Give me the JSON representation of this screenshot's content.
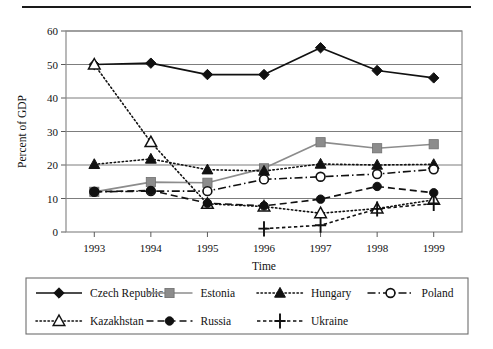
{
  "figure": {
    "has_top_rule": true
  },
  "chart_data": {
    "type": "line",
    "title": "",
    "xlabel": "Time",
    "ylabel": "Percent of GDP",
    "x": [
      1993,
      1994,
      1995,
      1996,
      1997,
      1998,
      1999
    ],
    "xtick_labels": [
      "1993",
      "1994",
      "1995",
      "1996",
      "1997",
      "1998",
      "1999"
    ],
    "ytick_labels": [
      "0",
      "10",
      "20",
      "30",
      "40",
      "50",
      "60"
    ],
    "ylim": [
      0,
      60
    ],
    "ytick_step": 10,
    "grid": "horizontal",
    "legend_position": "bottom-outside",
    "legend_columns": 4,
    "series": [
      {
        "name": "Czech Republic",
        "marker": "filled-diamond",
        "dash": "solid",
        "color": "#111111",
        "values": [
          50.0,
          50.4,
          47.0,
          47.0,
          55.0,
          48.2,
          46.0
        ]
      },
      {
        "name": "Estonia",
        "marker": "filled-square",
        "dash": "solid",
        "color": "#8c8c8c",
        "values": [
          12.0,
          14.9,
          14.7,
          19.0,
          26.8,
          25.0,
          26.2
        ]
      },
      {
        "name": "Hungary",
        "marker": "filled-triangle",
        "dash": "dotted",
        "color": "#111111",
        "values": [
          20.2,
          21.8,
          18.6,
          18.2,
          20.3,
          20.0,
          20.2
        ]
      },
      {
        "name": "Poland",
        "marker": "open-circle",
        "dash": "dashdot",
        "color": "#111111",
        "values": [
          12.0,
          12.2,
          12.2,
          15.7,
          16.5,
          17.3,
          18.7
        ]
      },
      {
        "name": "Kazakhstan",
        "marker": "open-triangle",
        "dash": "dotted",
        "color": "#111111",
        "values": [
          50.0,
          26.8,
          8.4,
          7.6,
          5.6,
          7.0,
          9.6
        ]
      },
      {
        "name": "Russia",
        "marker": "filled-circle",
        "dash": "dashed",
        "color": "#111111",
        "values": [
          12.0,
          12.4,
          8.6,
          7.8,
          9.8,
          13.6,
          11.7
        ]
      },
      {
        "name": "Ukraine",
        "marker": "plus",
        "dash": "dashed-fine",
        "color": "#111111",
        "values": [
          null,
          null,
          null,
          1.0,
          2.0,
          6.9,
          8.5
        ]
      }
    ]
  }
}
